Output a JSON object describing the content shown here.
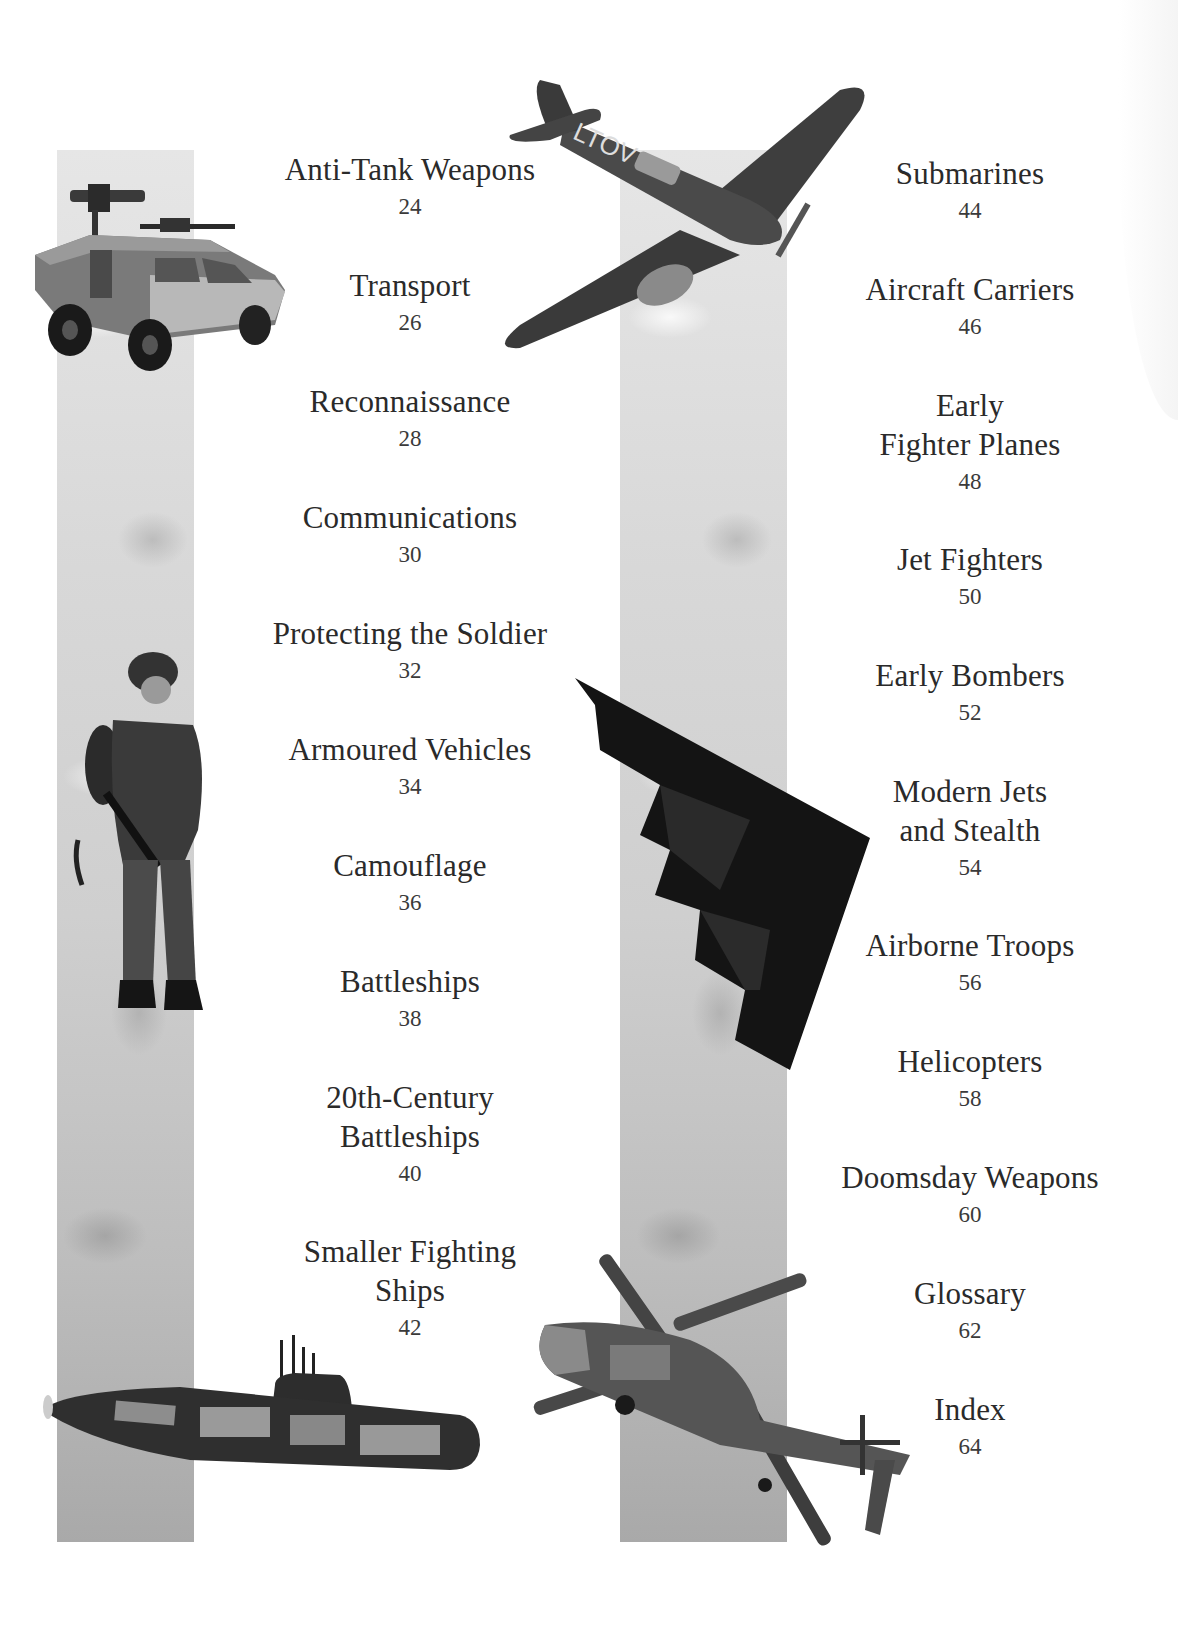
{
  "contents": {
    "left_column": [
      {
        "title": "Anti-Tank Weapons",
        "page": "24"
      },
      {
        "title": "Transport",
        "page": "26"
      },
      {
        "title": "Reconnaissance",
        "page": "28"
      },
      {
        "title": "Communications",
        "page": "30"
      },
      {
        "title": "Protecting the Soldier",
        "page": "32"
      },
      {
        "title": "Armoured Vehicles",
        "page": "34"
      },
      {
        "title": "Camouflage",
        "page": "36"
      },
      {
        "title": "Battleships",
        "page": "38"
      },
      {
        "title": "20th-Century\nBattleships",
        "page": "40"
      },
      {
        "title": "Smaller Fighting\nShips",
        "page": "42"
      }
    ],
    "right_column": [
      {
        "title": "Submarines",
        "page": "44"
      },
      {
        "title": "Aircraft Carriers",
        "page": "46"
      },
      {
        "title": "Early\nFighter Planes",
        "page": "48"
      },
      {
        "title": "Jet Fighters",
        "page": "50"
      },
      {
        "title": "Early Bombers",
        "page": "52"
      },
      {
        "title": "Modern Jets\nand Stealth",
        "page": "54"
      },
      {
        "title": "Airborne Troops",
        "page": "56"
      },
      {
        "title": "Helicopters",
        "page": "58"
      },
      {
        "title": "Doomsday Weapons",
        "page": "60"
      },
      {
        "title": "Glossary",
        "page": "62"
      },
      {
        "title": "Index",
        "page": "64"
      }
    ]
  },
  "illustrations": [
    {
      "name": "armoured-car",
      "description": "armoured vehicle with mounted guns"
    },
    {
      "name": "fighter-plane",
      "description": "WWII fighter plane marked TOV"
    },
    {
      "name": "soldier",
      "description": "soldier in camouflage with rifle"
    },
    {
      "name": "stealth-bomber",
      "description": "stealth bomber"
    },
    {
      "name": "submarine",
      "description": "submarine cutaway"
    },
    {
      "name": "helicopter",
      "description": "helicopter cutaway"
    }
  ],
  "plane_marking": "LTOV"
}
